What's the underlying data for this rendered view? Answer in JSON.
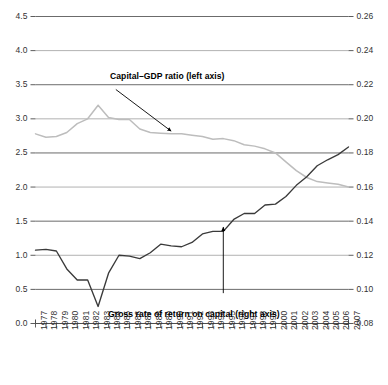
{
  "chart_data": {
    "type": "line",
    "title": "",
    "subtitle": "",
    "xlabel": "",
    "ylabel": "",
    "grid": true,
    "legend_position": "inline-annotations",
    "x": [
      1977,
      1978,
      1979,
      1980,
      1981,
      1982,
      1983,
      1984,
      1985,
      1986,
      1987,
      1988,
      1989,
      1990,
      1991,
      1992,
      1993,
      1994,
      1995,
      1996,
      1997,
      1998,
      1999,
      2000,
      2001,
      2002,
      2003,
      2004,
      2005,
      2006,
      2007
    ],
    "x_tick_labels": [
      "1977",
      "1978",
      "1979",
      "1980",
      "1981",
      "1982",
      "1983",
      "1984",
      "1985",
      "1986",
      "1987",
      "1988",
      "1989",
      "1990",
      "1991",
      "1992",
      "1993",
      "1994",
      "1995",
      "1996",
      "1997",
      "1998",
      "1999",
      "2000",
      "2001",
      "2002",
      "2003",
      "2004",
      "2005",
      "2006",
      "2007"
    ],
    "axes": {
      "left": {
        "label": "",
        "ylim": [
          0.0,
          4.5
        ],
        "ticks": [
          0.0,
          0.5,
          1.0,
          1.5,
          2.0,
          2.5,
          3.0,
          3.5,
          4.0,
          4.5
        ],
        "tick_labels": [
          "0.0",
          "0.5",
          "1.0",
          "1.5",
          "2.0",
          "2.5",
          "3.0",
          "3.5",
          "4.0",
          "4.5"
        ]
      },
      "right": {
        "label": "",
        "ylim": [
          0.08,
          0.26
        ],
        "ticks": [
          0.08,
          0.1,
          0.12,
          0.14,
          0.16,
          0.18,
          0.2,
          0.22,
          0.24,
          0.26
        ],
        "tick_labels": [
          "0.08",
          "0.10",
          "0.12",
          "0.14",
          "0.16",
          "0.18",
          "0.20",
          "0.22",
          "0.24",
          "0.26"
        ]
      }
    },
    "series": [
      {
        "name": "Capital–GDP ratio (left axis)",
        "axis": "left",
        "color": "#bdbdbd",
        "values": [
          2.78,
          2.73,
          2.74,
          2.8,
          2.93,
          3.0,
          3.2,
          3.02,
          2.99,
          2.99,
          2.85,
          2.8,
          2.79,
          2.78,
          2.78,
          2.76,
          2.74,
          2.7,
          2.71,
          2.68,
          2.62,
          2.6,
          2.56,
          2.5,
          2.37,
          2.24,
          2.14,
          2.08,
          2.06,
          2.04,
          2.0
        ]
      },
      {
        "name": "Gross rate of return on capital (right axis)",
        "axis": "right",
        "color": "#3a3a3a",
        "values": [
          0.123,
          0.1235,
          0.1225,
          0.112,
          0.1055,
          0.1055,
          0.09,
          0.1095,
          0.12,
          0.1195,
          0.118,
          0.1215,
          0.1265,
          0.1255,
          0.125,
          0.1275,
          0.1325,
          0.134,
          0.134,
          0.141,
          0.1445,
          0.1445,
          0.1495,
          0.15,
          0.1545,
          0.161,
          0.166,
          0.1725,
          0.176,
          0.179,
          0.1835
        ]
      }
    ],
    "annotations": [
      {
        "text": "Capital–GDP ratio (left axis)",
        "arrow_from": [
          1984.7,
          3.43
        ],
        "arrow_to": [
          1990.0,
          2.82
        ]
      },
      {
        "text": "Gross rate of return on capital (right axis)",
        "arrow_from": [
          1995.0,
          0.0978
        ],
        "arrow_to": [
          1995.0,
          0.1365
        ]
      }
    ]
  }
}
